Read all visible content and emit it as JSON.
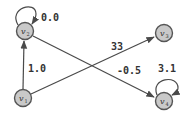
{
  "diagram": {
    "type": "weighted-directed-graph",
    "colors": {
      "node_fill": "#c9c9c9",
      "node_stroke": "#555555",
      "edge": "#4a4a4a",
      "text": "#333333"
    },
    "nodes": [
      {
        "id": "v1",
        "label": "v",
        "sub": "1",
        "x": 23,
        "y": 98
      },
      {
        "id": "v2",
        "label": "v",
        "sub": "2",
        "x": 25,
        "y": 31
      },
      {
        "id": "v3",
        "label": "v",
        "sub": "3",
        "x": 164,
        "y": 33
      },
      {
        "id": "v4",
        "label": "v",
        "sub": "4",
        "x": 164,
        "y": 101
      }
    ],
    "edges": [
      {
        "from": "v2",
        "to": "v2",
        "weight": "0.0",
        "kind": "self-loop"
      },
      {
        "from": "v1",
        "to": "v2",
        "weight": "1.0"
      },
      {
        "from": "v1",
        "to": "v3",
        "weight": "33"
      },
      {
        "from": "v2",
        "to": "v4",
        "weight": "-0.5"
      },
      {
        "from": "v4",
        "to": "v4",
        "weight": "3.1",
        "kind": "self-loop"
      }
    ]
  }
}
